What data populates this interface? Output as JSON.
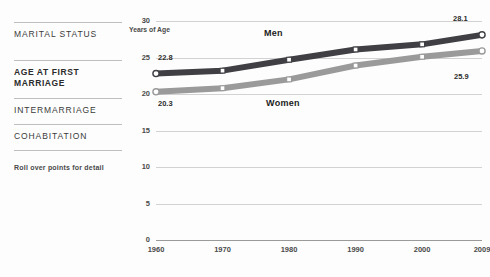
{
  "sidebar": {
    "items": [
      {
        "label": "MARITAL STATUS",
        "active": false
      },
      {
        "label": "AGE AT FIRST MARRIAGE",
        "active": true
      },
      {
        "label": "INTERMARRIAGE",
        "active": false
      },
      {
        "label": "COHABITATION",
        "active": false
      }
    ],
    "hint": "Roll over points for detail"
  },
  "colors": {
    "men": "#3f3f44",
    "women": "#9a9a9a",
    "grid": "#d2d2d2",
    "axis": "#9a9a9a",
    "text": "#3a3a3a"
  },
  "chart_data": {
    "type": "line",
    "title": "",
    "xlabel": "",
    "ylabel": "Years of Age",
    "x": [
      1960,
      1970,
      1980,
      1990,
      2000,
      2009
    ],
    "xticklabels": [
      "1960",
      "1970",
      "1980",
      "1990",
      "2000",
      "2009"
    ],
    "ylim": [
      0,
      30
    ],
    "yticks": [
      0,
      5,
      10,
      15,
      20,
      25,
      30
    ],
    "yticklabels": [
      "0",
      "5",
      "10",
      "15",
      "20",
      "25",
      "30"
    ],
    "grid": true,
    "legend": "inline",
    "series": [
      {
        "name": "Men",
        "color": "#3f3f44",
        "values": [
          22.8,
          23.2,
          24.7,
          26.1,
          26.8,
          28.1
        ],
        "start_label": "22.8",
        "end_label": "28.1"
      },
      {
        "name": "Women",
        "color": "#9a9a9a",
        "values": [
          20.3,
          20.8,
          22.0,
          23.9,
          25.1,
          25.9
        ],
        "start_label": "20.3",
        "end_label": "25.9"
      }
    ]
  }
}
